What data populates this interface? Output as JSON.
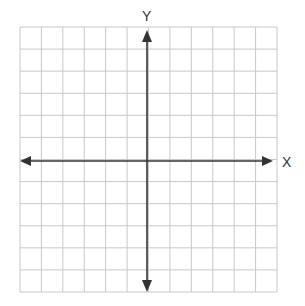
{
  "diagram": {
    "type": "coordinate-plane",
    "x_axis_label": "X",
    "y_axis_label": "Y",
    "grid": {
      "columns": 12,
      "rows": 12,
      "left": 20,
      "top": 27,
      "right": 277,
      "bottom": 292
    },
    "origin": {
      "x": 147,
      "y": 161
    },
    "colors": {
      "grid": "#c8c8c8",
      "axis": "#333333"
    }
  }
}
